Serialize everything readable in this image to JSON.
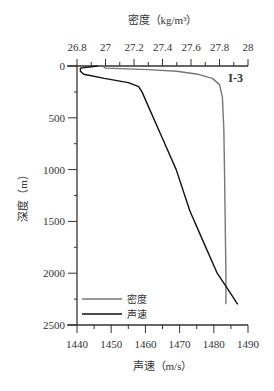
{
  "chart_data": {
    "type": "line",
    "panel_label": "I-3",
    "top_axis": {
      "label": "密度（kg/m³）",
      "ticks": [
        "26.8",
        "27",
        "27.2",
        "27.4",
        "27.6",
        "27.8",
        "28"
      ],
      "range": [
        26.8,
        28.0
      ]
    },
    "bottom_axis": {
      "label": "声速（m/s）",
      "ticks": [
        "1440",
        "1450",
        "1460",
        "1470",
        "1480",
        "1490"
      ],
      "range": [
        1440,
        1490
      ]
    },
    "y_axis": {
      "label": "深度（m）",
      "ticks": [
        "0",
        "500",
        "1000",
        "1500",
        "2000",
        "2500"
      ],
      "range": [
        0,
        2500
      ],
      "inverted": true
    },
    "legend": [
      {
        "name": "密度",
        "color": "#777777"
      },
      {
        "name": "声速",
        "color": "#111111"
      }
    ],
    "series": [
      {
        "name": "密度",
        "axis": "top",
        "color": "#777777",
        "points": [
          [
            26.98,
            0
          ],
          [
            27.0,
            20
          ],
          [
            27.3,
            35
          ],
          [
            27.5,
            50
          ],
          [
            27.65,
            80
          ],
          [
            27.75,
            120
          ],
          [
            27.8,
            180
          ],
          [
            27.82,
            300
          ],
          [
            27.83,
            600
          ],
          [
            27.835,
            1000
          ],
          [
            27.84,
            1500
          ],
          [
            27.845,
            2000
          ],
          [
            27.845,
            2300
          ]
        ]
      },
      {
        "name": "声速",
        "axis": "bottom",
        "color": "#111111",
        "points": [
          [
            1446,
            0
          ],
          [
            1441,
            20
          ],
          [
            1441,
            50
          ],
          [
            1442,
            80
          ],
          [
            1448,
            120
          ],
          [
            1455,
            160
          ],
          [
            1458,
            200
          ],
          [
            1459,
            250
          ],
          [
            1461,
            400
          ],
          [
            1465,
            700
          ],
          [
            1469,
            1000
          ],
          [
            1473,
            1400
          ],
          [
            1477,
            1700
          ],
          [
            1481,
            2000
          ],
          [
            1484,
            2150
          ],
          [
            1487,
            2300
          ]
        ]
      }
    ]
  }
}
